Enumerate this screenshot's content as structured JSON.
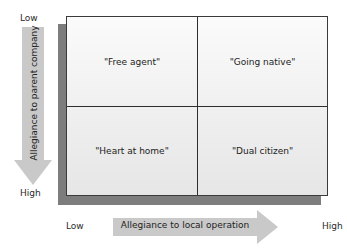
{
  "diagram": {
    "type": "2x2 matrix",
    "y_axis": {
      "label": "Allegiance to parent company",
      "top_label": "Low",
      "bottom_label": "High",
      "direction": "down"
    },
    "x_axis": {
      "label": "Allegiance to local operation",
      "left_label": "Low",
      "right_label": "High",
      "direction": "right"
    },
    "quadrants": [
      {
        "position": "top-left",
        "label": "\"Free agent\""
      },
      {
        "position": "top-right",
        "label": "\"Going native\""
      },
      {
        "position": "bottom-left",
        "label": "\"Heart at home\""
      },
      {
        "position": "bottom-right",
        "label": "\"Dual citizen\""
      }
    ],
    "colors": {
      "arrow_fill": "#c9c9c9",
      "shadow": "#7d7d7d",
      "grid_line": "#2e2e2e",
      "cell_bg": "#f2f2f2"
    }
  }
}
